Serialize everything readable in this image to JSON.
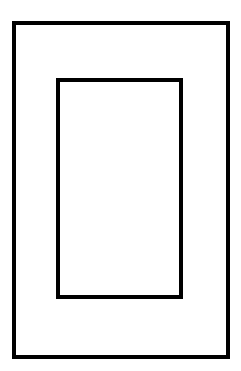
{
  "diagram": {
    "shapes": [
      {
        "id": "outer",
        "type": "rectangle",
        "stroke": "#000000",
        "fill": "none"
      },
      {
        "id": "inner",
        "type": "rectangle",
        "stroke": "#000000",
        "fill": "none"
      }
    ]
  }
}
